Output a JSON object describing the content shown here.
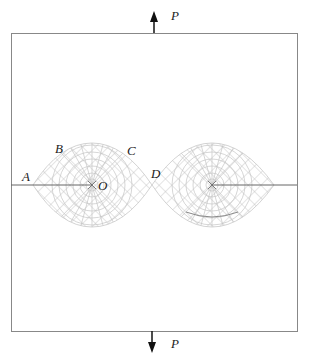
{
  "figure": {
    "type": "fracture-mechanics mesh diagram",
    "load_label_top": "P",
    "load_label_bottom": "P",
    "point_labels": {
      "A": "A",
      "B": "B",
      "C": "C",
      "D": "D",
      "O": "O"
    },
    "colors": {
      "frame": "#888888",
      "mesh": "#b8b8b8",
      "crack": "#555555",
      "arrow": "#111111",
      "text": "#222222"
    }
  }
}
